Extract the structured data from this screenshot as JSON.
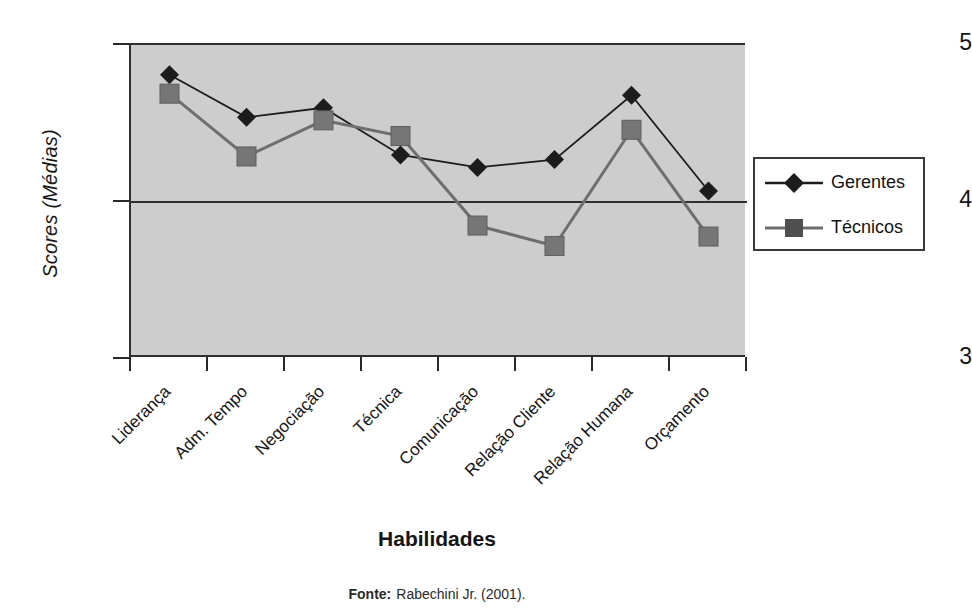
{
  "chart_data": {
    "type": "line",
    "title": "",
    "xlabel": "Habilidades",
    "ylabel": "Scores (Médias)",
    "ylim": [
      3,
      5
    ],
    "yticks": [
      5,
      4,
      3
    ],
    "grid": false,
    "legend_position": "right",
    "categories": [
      "Liderança",
      "Adm. Tempo",
      "Negociação",
      "Técnica",
      "Comunicação",
      "Relação Cliente",
      "Relação Humana",
      "Orçamento"
    ],
    "series": [
      {
        "name": "Gerentes",
        "marker": "diamond",
        "color": "#1c1c1c",
        "values": [
          4.81,
          4.54,
          4.6,
          4.3,
          4.22,
          4.27,
          4.68,
          4.07
        ]
      },
      {
        "name": "Técnicos",
        "marker": "square",
        "color": "#6e6e6e",
        "values": [
          4.69,
          4.29,
          4.52,
          4.42,
          3.85,
          3.72,
          4.46,
          3.78
        ]
      }
    ]
  },
  "axis": {
    "y_title": "Scores (Médias)",
    "y_tick_top": "5",
    "y_tick_mid": "4",
    "y_tick_bottom": "3",
    "x_title": "Habilidades"
  },
  "legend": {
    "items": [
      {
        "label": "Gerentes"
      },
      {
        "label": "Técnicos"
      }
    ]
  },
  "source": {
    "label": "Fonte:",
    "text": "Rabechini Jr. (2001)."
  },
  "colors": {
    "plot_background": "#cdcdcd",
    "axis": "#2f2f2f",
    "series_gerentes": "#1c1c1c",
    "series_tecnicos": "#6e6e6e",
    "page_background": "#ffffff"
  }
}
